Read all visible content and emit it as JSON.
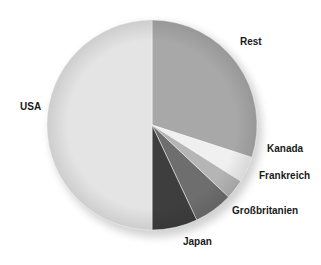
{
  "chart_data": {
    "type": "pie",
    "title": "",
    "categories": [
      "USA",
      "Rest",
      "Kanada",
      "Frankreich",
      "Großbritanien",
      "Japan"
    ],
    "values": [
      50,
      30,
      4,
      3,
      6,
      7
    ],
    "unit": "%",
    "colors": [
      "#e4e4e4",
      "#a8a8a8",
      "#f0f0f0",
      "#b5b5b5",
      "#6e6e6e",
      "#3e3e3e"
    ],
    "start_angle_deg": 0,
    "direction": "clockwise_from_top",
    "order_clockwise_from_top": [
      "Rest",
      "Kanada",
      "Frankreich",
      "Großbritanien",
      "Japan",
      "USA"
    ],
    "legend": "none (direct labels)"
  },
  "labels": {
    "usa": "USA",
    "rest": "Rest",
    "kanada": "Kanada",
    "frankreich": "Frankreich",
    "grossbritanien": "Großbritanien",
    "japan": "Japan"
  }
}
